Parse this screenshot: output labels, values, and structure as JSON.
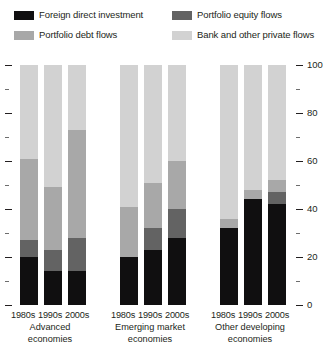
{
  "chart_data": {
    "type": "bar",
    "subtype": "stacked-percentage-grouped",
    "title": "",
    "subtitle": "",
    "xlabel": "",
    "ylabel": "",
    "ylim": [
      0,
      100
    ],
    "ytick_labels": [
      "0",
      "20",
      "40",
      "60",
      "80",
      "100"
    ],
    "ytick_values": [
      0,
      20,
      40,
      60,
      80,
      100
    ],
    "yminor_values": [
      10,
      30,
      50,
      70,
      90
    ],
    "grid": false,
    "legend_position": "top",
    "legend": [
      {
        "name": "Foreign direct investment",
        "color": "#100f10"
      },
      {
        "name": "Portfolio equity flows",
        "color": "#636363"
      },
      {
        "name": "Portfolio debt flows",
        "color": "#a8a8a8"
      },
      {
        "name": "Bank and other private flows",
        "color": "#d2d2d2"
      }
    ],
    "categories": [
      "1980s",
      "1990s",
      "2000s"
    ],
    "groups": [
      {
        "name": "Advanced economies",
        "label_lines": [
          "Advanced",
          "economies"
        ],
        "bars": [
          {
            "category": "1980s",
            "values": {
              "Foreign direct investment": 20,
              "Portfolio equity flows": 7,
              "Portfolio debt flows": 34,
              "Bank and other private flows": 39
            }
          },
          {
            "category": "1990s",
            "values": {
              "Foreign direct investment": 14,
              "Portfolio equity flows": 9,
              "Portfolio debt flows": 26,
              "Bank and other private flows": 51
            }
          },
          {
            "category": "2000s",
            "values": {
              "Foreign direct investment": 14,
              "Portfolio equity flows": 14,
              "Portfolio debt flows": 45,
              "Bank and other private flows": 27
            }
          }
        ]
      },
      {
        "name": "Emerging market economies",
        "label_lines": [
          "Emerging market",
          "economies"
        ],
        "bars": [
          {
            "category": "1980s",
            "values": {
              "Foreign direct investment": 20,
              "Portfolio equity flows": 0,
              "Portfolio debt flows": 21,
              "Bank and other private flows": 59
            }
          },
          {
            "category": "1990s",
            "values": {
              "Foreign direct investment": 23,
              "Portfolio equity flows": 9,
              "Portfolio debt flows": 19,
              "Bank and other private flows": 49
            }
          },
          {
            "category": "2000s",
            "values": {
              "Foreign direct investment": 28,
              "Portfolio equity flows": 12,
              "Portfolio debt flows": 20,
              "Bank and other private flows": 40
            }
          }
        ]
      },
      {
        "name": "Other developing economies",
        "label_lines": [
          "Other developing",
          "economies"
        ],
        "bars": [
          {
            "category": "1980s",
            "values": {
              "Foreign direct investment": 32,
              "Portfolio equity flows": 0,
              "Portfolio debt flows": 4,
              "Bank and other private flows": 64
            }
          },
          {
            "category": "1990s",
            "values": {
              "Foreign direct investment": 44,
              "Portfolio equity flows": 0,
              "Portfolio debt flows": 4,
              "Bank and other private flows": 52
            }
          },
          {
            "category": "2000s",
            "values": {
              "Foreign direct investment": 42,
              "Portfolio equity flows": 5,
              "Portfolio debt flows": 5,
              "Bank and other private flows": 48
            }
          }
        ]
      }
    ]
  }
}
